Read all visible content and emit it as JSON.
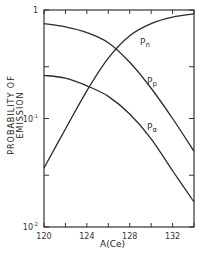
{
  "chart_data": {
    "type": "line",
    "title": "",
    "xlabel": "A(Ce)",
    "ylabel": "PROBABILITY OF EMISSION",
    "yscale": "log",
    "xlim": [
      120,
      134
    ],
    "ylim": [
      0.01,
      1
    ],
    "x_ticks": [
      120,
      122,
      124,
      126,
      128,
      130,
      132,
      134
    ],
    "x_tick_labels": [
      "120",
      "124",
      "128",
      "132"
    ],
    "y_tick_labels": [
      "10^-2",
      "10^-1",
      "1"
    ],
    "grid": false,
    "legend": "inline labels",
    "x": [
      120,
      122,
      124,
      126,
      128,
      130,
      132,
      134
    ],
    "series": [
      {
        "name": "Pn",
        "label": "P_n",
        "values": [
          0.035,
          0.08,
          0.18,
          0.36,
          0.58,
          0.75,
          0.86,
          0.92
        ]
      },
      {
        "name": "Pp",
        "label": "P_p",
        "values": [
          0.75,
          0.7,
          0.62,
          0.5,
          0.33,
          0.19,
          0.1,
          0.05
        ]
      },
      {
        "name": "Pa",
        "label": "P_alpha",
        "values": [
          0.25,
          0.235,
          0.2,
          0.16,
          0.11,
          0.065,
          0.033,
          0.017
        ]
      }
    ]
  },
  "labels": {
    "ylabel": "PROBABILITY OF EMISSION",
    "xlabel": "A(Ce)",
    "y_ticks": [
      {
        "base": "10",
        "exp": "-2"
      },
      {
        "base": "10",
        "exp": "-1"
      },
      {
        "base": "1",
        "exp": ""
      }
    ],
    "x_ticks": [
      "120",
      "124",
      "128",
      "132"
    ],
    "curve_labels": {
      "pn": "n",
      "pp": "p",
      "pa": "α",
      "P": "P"
    }
  }
}
